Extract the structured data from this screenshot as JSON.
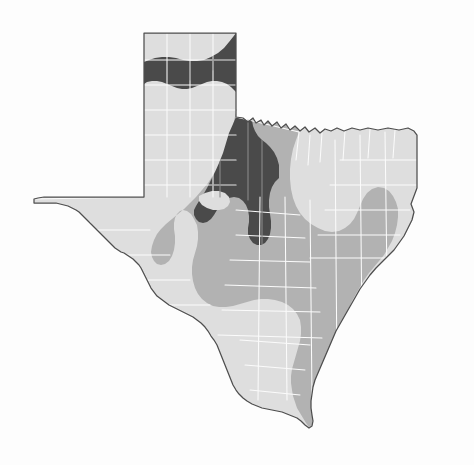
{
  "figure": {
    "type": "choropleth-map",
    "title": "",
    "caption": "",
    "background_color": "#fdfdfd",
    "has_legend": false,
    "has_labels": false,
    "has_axes": false,
    "state_outline_color": "#4e4e4e",
    "county_line_color": "#fbfbfb",
    "county_line_color_on_dark": "#8c8c8c"
  },
  "chart_data": {
    "type": "heatmap",
    "title": "",
    "subtitle": "",
    "xlabel": "",
    "ylabel": "",
    "grid": false,
    "legend_position": "none",
    "region": "Texas",
    "unit_geometry": "counties",
    "classification_scheme": "three-class graduated gray",
    "classes": [
      {
        "rank": 1,
        "name": "low",
        "color": "#dedede",
        "description": "lightest shade; covers far West Texas, Trans-Pecos, Big Bend, the western Panhandle, South Texas / Rio Grande Plain, and a corridor through North Central and Northeast Texas",
        "approx_area_share_percent": 52
      },
      {
        "rank": 2,
        "name": "medium",
        "color": "#b2b2b2",
        "description": "mid shade; forms a broad band across Central Texas and the Edwards Plateau, sweeping northeast across the Cross Timbers into Northeast Texas and down the Gulf Coastal Plain to the lower coast",
        "approx_area_share_percent": 36
      },
      {
        "rank": 3,
        "name": "high",
        "color": "#4a4a4a",
        "description": "darkest shade; a contiguous block over the eastern Panhandle, the Texas South Plains / Llano Estacado and the Rolling Plains, containing one interior light enclave",
        "approx_area_share_percent": 12
      }
    ],
    "zones": [
      {
        "id": "zone-low",
        "class": "low",
        "color": "#dedede",
        "label": ""
      },
      {
        "id": "zone-medium",
        "class": "medium",
        "color": "#b2b2b2",
        "label": ""
      },
      {
        "id": "zone-high",
        "class": "high",
        "color": "#4a4a4a",
        "label": ""
      },
      {
        "id": "zone-high-enclave",
        "class": "low",
        "color": "#dedede",
        "label": ""
      }
    ]
  },
  "geometry": {
    "viewbox": "0 0 474 465",
    "state_outline_path": "M144 33 L236 33 L236 117 L243 118 L248 122 L253 118 L256 123 L261 120 L264 125 L268 121 L272 126 L277 122 L281 128 L286 124 L290 130 L295 126 L300 131 L305 127 L309 132 L315 128 L320 133 L325 129 L331 131 L337 128 L344 131 L352 128 L360 130 L368 128 L378 130 L388 128 L399 130 L408 128 L414 131 L417 135 L417 188 L414 196 L411 204 L414 212 L412 220 L408 228 L404 236 L399 243 L394 250 L388 256 L382 262 L376 268 L370 275 L365 282 L360 289 L356 296 L352 303 L348 310 L344 317 L340 324 L336 331 L333 338 L330 345 L327 352 L324 359 L321 366 L318 373 L315 380 L313 387 L312 394 L311 401 L311 408 L312 415 L313 421 L312 426 L309 428 L305 425 L301 421 L297 418 L292 416 L287 414 L282 412 L277 411 L272 410 L267 409 L262 408 L257 406 L252 404 L247 401 L243 398 L239 394 L236 390 L233 385 L231 380 L229 375 L227 370 L225 365 L223 360 L221 355 L219 350 L217 345 L214 340 L211 336 L208 331 L205 327 L201 323 L197 320 L193 317 L189 315 L185 313 L181 311 L177 309 L173 307 L169 305 L165 302 L161 299 L157 296 L154 292 L151 288 L149 284 L147 280 L145 276 L143 272 L141 268 L139 265 L136 262 L133 259 L130 257 L127 255 L124 253 L121 252 L118 250 L115 248 L112 245 L109 242 L106 239 L103 236 L100 233 L97 230 L94 227 L91 224 L88 221 L85 218 L82 215 L79 212 L76 210 L72 208 L68 206 L64 205 L60 204 L56 203 L52 203 L48 203 L44 203 L40 203 L36 203 L34 203 L34 199 L38 198 L44 197 L52 197 L62 197 L74 197 L88 197 L104 197 L120 197 L134 197 L144 197 Z",
    "zone_low_path": "M144 33 L236 33 L236 117 L243 118 L248 122 L253 118 L256 123 L261 120 L264 125 L268 121 L272 126 L277 122 L281 128 L286 124 L290 130 L295 126 L300 131 L305 127 L309 132 L315 128 L320 133 L325 129 L331 131 L337 128 L344 131 L352 128 L360 130 L368 128 L378 130 L388 128 L399 130 L408 128 L414 131 L417 135 L417 188 L414 196 L411 204 L414 212 L412 220 L408 228 L404 236 L399 243 L394 250 L388 256 L382 262 L376 268 L370 275 L365 282 L360 289 L356 296 L352 303 L348 310 L344 317 L340 324 L336 331 L333 338 L330 345 L327 352 L324 359 L321 366 L318 373 L315 380 L313 387 L312 394 L311 401 L311 408 L312 415 L313 421 L312 426 L309 428 L305 425 L301 421 L297 418 L292 416 L287 414 L282 412 L277 411 L272 410 L267 409 L262 408 L257 406 L252 404 L247 401 L243 398 L239 394 L236 390 L233 385 L231 380 L229 375 L227 370 L225 365 L223 360 L221 355 L219 350 L217 345 L214 340 L211 336 L208 331 L205 327 L201 323 L197 320 L193 317 L189 315 L185 313 L181 311 L177 309 L173 307 L169 305 L165 302 L161 299 L157 296 L154 292 L151 288 L149 284 L147 280 L145 276 L143 272 L141 268 L139 265 L136 262 L133 259 L130 257 L127 255 L124 253 L121 252 L118 250 L115 248 L112 245 L109 242 L106 239 L103 236 L100 233 L97 230 L94 227 L91 224 L88 221 L85 218 L82 215 L79 212 L76 210 L72 208 L68 206 L64 205 L60 204 L56 203 L52 203 L48 203 L44 203 L40 203 L36 203 L34 203 L34 199 L38 198 L44 197 L52 197 L62 197 L74 197 L88 197 L104 197 L120 197 L134 197 L144 197 Z",
    "zone_medium_path": "M236 112 L243 118 L248 122 L253 118 L256 123 L261 120 L264 125 L268 121 L272 126 L277 122 L281 128 L286 124 L290 130 L295 126 L299 132 L296 140 L293 149 L291 159 L290 169 L290 179 L291 189 L293 198 L296 206 L300 213 L305 219 L311 224 L318 228 L325 231 L332 232 L339 231 L345 228 L350 224 L354 219 L357 213 L360 206 L363 199 L367 193 L372 189 L378 187 L384 188 L389 191 L393 196 L396 202 L398 209 L398 217 L397 225 L395 233 L392 241 L388 248 L384 255 L379 261 L374 267 L369 273 L364 280 L360 287 L356 294 L352 301 L349 308 L346 315 L343 322 L340 329 L337 336 L334 343 L331 350 L328 357 L325 364 L322 371 L319 378 L316 385 L314 392 L313 399 L312 406 L312 413 L313 419 L312 425 L309 427 L306 423 L303 418 L300 413 L297 408 L295 402 L293 396 L292 390 L291 383 L291 376 L292 369 L294 362 L296 355 L298 348 L300 341 L301 334 L301 327 L300 320 L297 314 L293 309 L288 305 L282 302 L275 300 L268 299 L261 299 L254 300 L247 302 L240 304 L233 306 L226 307 L219 307 L213 306 L207 303 L202 299 L198 294 L195 288 L193 281 L192 274 L192 267 L193 260 L195 253 L197 246 L198 239 L198 232 L197 225 L194 219 L191 214 L187 211 L183 210 L180 211 L177 214 L175 218 L174 223 L174 229 L175 236 L175 243 L174 250 L172 256 L169 261 L165 264 L161 265 L157 264 L154 261 L152 257 L151 252 L152 246 L154 240 L157 234 L161 229 L166 224 L172 219 L178 214 L184 209 L190 203 L196 197 L202 190 L208 183 L213 175 L218 167 L222 158 L226 149 L229 140 L232 130 L234 121 Z",
    "zone_high_path": "M236 33 L236 117 L233 124 L229 133 L226 143 L223 153 L219 163 L215 172 L211 180 L207 188 L203 195 L199 201 L196 206 L194 210 L194 215 L196 219 L199 222 L203 223 L207 222 L211 219 L214 215 L217 210 L220 205 L224 201 L229 198 L234 197 L239 198 L243 201 L246 205 L248 210 L249 216 L249 222 L248 228 L248 234 L250 239 L253 243 L257 245 L261 245 L265 243 L268 239 L270 234 L271 228 L271 221 L270 214 L269 207 L269 200 L270 193 L272 187 L275 182 L279 178 L279 165 L277 158 L274 152 L270 147 L266 143 L262 140 L258 136 L255 131 L253 126 L252 120 L252 114 L250 108 L247 103 L243 99 L239 95 L235 91 L231 87 L227 84 L222 82 L217 81 L212 81 L207 82 L202 84 L197 86 L192 88 L187 89 L182 89 L177 88 L172 86 L167 84 L162 82 L157 81 L152 81 L147 82 L144 84 L144 62 L149 60 L155 58 L162 57 L169 57 L176 58 L183 60 L190 61 L197 61 L204 60 L211 57 L218 53 L224 48 L229 42 L233 37 Z",
    "zone_high_enclave_path": "M199 196 L205 193 L212 191 L219 191 L225 193 L229 197 L230 202 L228 206 L224 209 L219 210 L213 210 L207 208 L202 205 L199 201 Z",
    "county_lines_light_paths": [
      "M144 60 L236 60 M144 85 L236 85 M144 110 L236 110 M144 135 L236 135 M144 160 L236 160 M144 185 L236 185",
      "M167 33 L167 197 M190 33 L190 197 M213 33 L213 197",
      "M144 197 L34 199 M236 117 L299 132",
      "M236 210 L300 215 M236 235 L305 238 M230 260 L310 262 M225 285 L316 288 M222 310 L320 312 M218 335 L322 338",
      "M260 197 L258 400 M285 197 L287 400 M310 200 L312 400 M335 140 L337 370 M360 135 L362 330 M385 132 L387 280",
      "M34 203 L60 230 M60 204 L75 240 M90 222 L110 260 M120 252 L140 290 M150 288 L175 320 M180 312 L205 345",
      "M40 230 L150 230 M60 255 L170 255 M85 280 L190 280 M110 305 L210 305",
      "M417 160 L340 160 M417 185 L330 185 M410 210 L325 210 M400 235 L318 235 M390 258 L310 258",
      "M299 132 L296 160 M310 135 L308 165 M322 133 L320 162 M345 131 L343 160 M370 129 L368 158 M395 130 L393 158",
      "M250 390 L300 395 M245 365 L305 370 M240 340 L310 345"
    ],
    "county_lines_dark_paths": [
      "M236 60 L213 60 M236 85 L200 85 M236 110 L190 110 M236 135 L200 135 M236 160 L196 160 M236 185 L205 185",
      "M213 33 L213 70 M190 45 L190 80 M220 90 L220 197 M248 120 L248 200 M262 140 L262 245"
    ]
  }
}
